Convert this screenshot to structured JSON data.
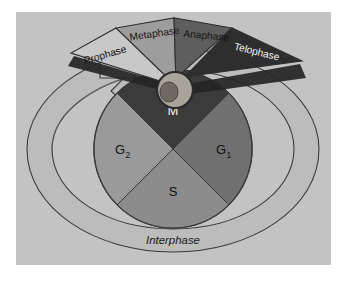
{
  "figure": {
    "background_color": "#ffffff",
    "panel_color": "#c3c3c3",
    "outline_color": "#2a2a2a"
  },
  "interphase": {
    "label": "Interphase",
    "ring_color": "#bcbcbc",
    "arrow_label": "interphase-arrow"
  },
  "cell": {
    "membrane_color": "#a8a49a",
    "nucleus_color": "#6e6a63",
    "label": "dividing-cell"
  },
  "quadrants": [
    {
      "key": "M",
      "label": "M",
      "sub": "",
      "color": "#3b3b3b",
      "text_color": "#efefef"
    },
    {
      "key": "G1",
      "label": "G",
      "sub": "1",
      "color": "#707070",
      "text_color": "#111111"
    },
    {
      "key": "S",
      "label": "S",
      "sub": "",
      "color": "#8c8c8c",
      "text_color": "#111111"
    },
    {
      "key": "G2",
      "label": "G",
      "sub": "2",
      "color": "#9a9a9a",
      "text_color": "#111111"
    }
  ],
  "mitosis_phases": [
    {
      "key": "prophase",
      "label": "Prophase",
      "color": "#c8c8c8",
      "text_color": "#141414"
    },
    {
      "key": "metaphase",
      "label": "Metaphase",
      "color": "#9d9d9d",
      "text_color": "#141414"
    },
    {
      "key": "anaphase",
      "label": "Anaphase",
      "color": "#5e5e5e",
      "text_color": "#141414"
    },
    {
      "key": "telophase",
      "label": "Telophase",
      "color": "#2e2e2e",
      "text_color": "#e8e8e8"
    }
  ]
}
